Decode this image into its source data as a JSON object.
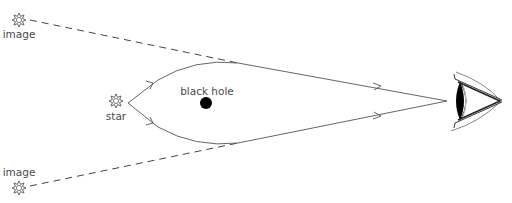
{
  "diagram": {
    "labels": {
      "image_top": "image",
      "image_bottom": "image",
      "star": "star",
      "black_hole": "black hole"
    },
    "icons": {
      "star": "star-burst-icon",
      "image": "star-burst-icon",
      "observer": "eye-icon"
    },
    "colors": {
      "line": "#555555",
      "black_hole": "#000000",
      "text": "#4a4a4a"
    }
  }
}
